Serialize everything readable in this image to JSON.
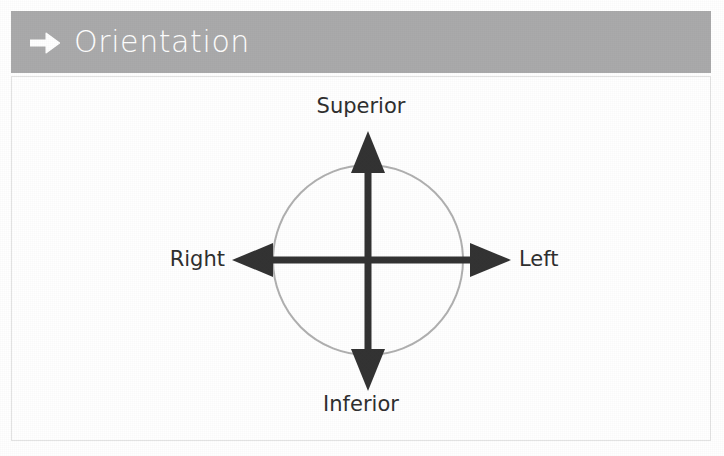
{
  "slide": {
    "title": "Orientation",
    "title_bar_color": "#aaaaab",
    "title_text_color": "#ffffff",
    "title_arrow_icon": "arrow-right-icon",
    "panel_background": "#ffffff",
    "panel_border_color": "#e3e3e3"
  },
  "diagram": {
    "name": "anatomical-orientation-axes",
    "circle": {
      "center_x": 357,
      "center_y": 184,
      "radius": 95,
      "stroke_color": "#b0b0b0",
      "stroke_width": 2,
      "fill": "none"
    },
    "axis_color": "#333333",
    "axis_stroke_width": 7,
    "axes": [
      {
        "name": "superior-axis",
        "label": "Superior",
        "direction": "up",
        "tip_x": 357,
        "tip_y": 57
      },
      {
        "name": "inferior-axis",
        "label": "Inferior",
        "direction": "down",
        "tip_x": 357,
        "tip_y": 314
      },
      {
        "name": "right-axis",
        "label": "Right",
        "direction": "left",
        "tip_x": 222,
        "tip_y": 184
      },
      {
        "name": "left-axis",
        "label": "Left",
        "direction": "right",
        "tip_x": 499,
        "tip_y": 184
      }
    ],
    "labels": {
      "superior": "Superior",
      "inferior": "Inferior",
      "right": "Right",
      "left": "Left"
    }
  }
}
